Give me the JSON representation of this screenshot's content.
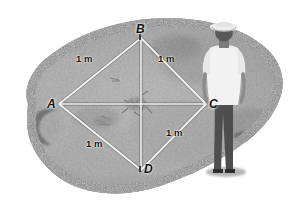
{
  "figure": {
    "type": "photograph-diagram",
    "background_color": "#ffffff",
    "palette": {
      "grass_light": "#bdbdbd",
      "grass_mid": "#9a9a9a",
      "grass_dark": "#6f6f6f",
      "soil_dark": "#4a4a4a",
      "rope_white": "#f2f2f2",
      "shirt_white": "#f4f4f4",
      "pants_dark": "#4c4c4c",
      "label_black": "#111111"
    }
  },
  "plot": {
    "shape": "square-rotated-diamond",
    "vertices": [
      {
        "id": "A",
        "label": "A",
        "x": 59,
        "y": 104,
        "position": "left"
      },
      {
        "id": "B",
        "label": "B",
        "x": 141,
        "y": 38,
        "position": "top"
      },
      {
        "id": "C",
        "label": "C",
        "x": 206,
        "y": 104,
        "position": "right"
      },
      {
        "id": "D",
        "label": "D",
        "x": 141,
        "y": 170,
        "position": "bottom"
      }
    ],
    "sides": [
      {
        "from": "A",
        "to": "B",
        "label": "1 m",
        "x": 78,
        "y": 54
      },
      {
        "from": "B",
        "to": "C",
        "label": "1 m",
        "x": 160,
        "y": 54
      },
      {
        "from": "C",
        "to": "D",
        "label": "1 m",
        "x": 168,
        "y": 132
      },
      {
        "from": "D",
        "to": "A",
        "label": "1 m",
        "x": 88,
        "y": 141
      }
    ],
    "diagonals": [
      {
        "from": "A",
        "to": "C"
      },
      {
        "from": "B",
        "to": "D"
      }
    ]
  },
  "person": {
    "name": "standing-observer",
    "hat": "white wide-brim hat",
    "shirt": "white short-sleeve shirt",
    "trousers": "dark trousers",
    "facing": "away from viewer"
  }
}
